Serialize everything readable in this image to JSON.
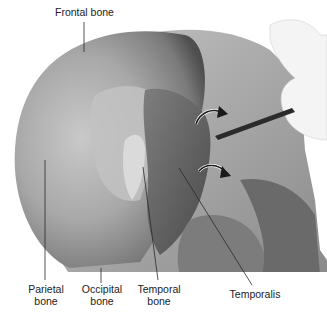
{
  "figure": {
    "labels": {
      "frontal": "Frontal bone",
      "parietal": "Parietal\nbone",
      "occipital": "Occipital\nbone",
      "temporal_bone": "Temporal\nbone",
      "temporalis": "Temporalis"
    },
    "colors": {
      "background": "#ffffff",
      "skull_light": "#d8d8d8",
      "skull_mid": "#a9a9a9",
      "skull_dark": "#5a5a5a",
      "muscle": "#6b6b6b",
      "leader_line": "#2a2a2a",
      "arrow": "#1a1a1a"
    }
  }
}
